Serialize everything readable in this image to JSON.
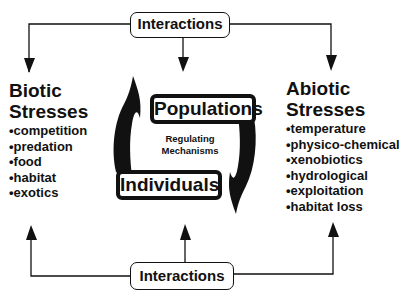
{
  "top_box": {
    "label": "Interactions"
  },
  "bottom_box": {
    "label": "Interactions"
  },
  "biotic": {
    "title_line1": "Biotic",
    "title_line2": "Stresses",
    "items": [
      "competition",
      "predation",
      "food",
      "habitat",
      "exotics"
    ]
  },
  "abiotic": {
    "title_line1": "Abiotic",
    "title_line2": "Stresses",
    "items": [
      "temperature",
      "physico-chemical",
      "xenobiotics",
      "hydrological",
      "exploitation",
      "habitat loss"
    ]
  },
  "cycle": {
    "populations": "Populations",
    "individuals": "Individuals",
    "center_line1": "Regulating",
    "center_line2": "Mechanisms"
  },
  "colors": {
    "ink": "#111111",
    "background": "#ffffff"
  }
}
